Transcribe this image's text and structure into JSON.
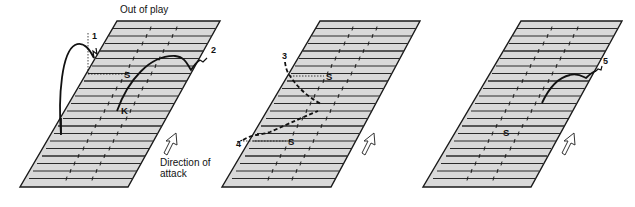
{
  "labels": {
    "out_of_play": "Out of play",
    "direction_line1": "Direction of",
    "direction_line2": "attack"
  },
  "colors": {
    "field_fill": "#d9d9d9",
    "line": "#1a1a1a",
    "background": "#ffffff"
  },
  "panels": [
    {
      "id": "left",
      "markers": [
        {
          "text": "1",
          "role": "kick-number"
        },
        {
          "text": "2",
          "role": "kick-number"
        },
        {
          "text": "S",
          "role": "scrum-half-position"
        },
        {
          "text": "K",
          "role": "kicker-position"
        }
      ]
    },
    {
      "id": "middle",
      "markers": [
        {
          "text": "3",
          "role": "kick-number"
        },
        {
          "text": "4",
          "role": "kick-number"
        },
        {
          "text": "S",
          "role": "position"
        },
        {
          "text": "S",
          "role": "position"
        }
      ]
    },
    {
      "id": "right",
      "markers": [
        {
          "text": "5",
          "role": "kick-number"
        },
        {
          "text": "S",
          "role": "position"
        }
      ]
    }
  ]
}
